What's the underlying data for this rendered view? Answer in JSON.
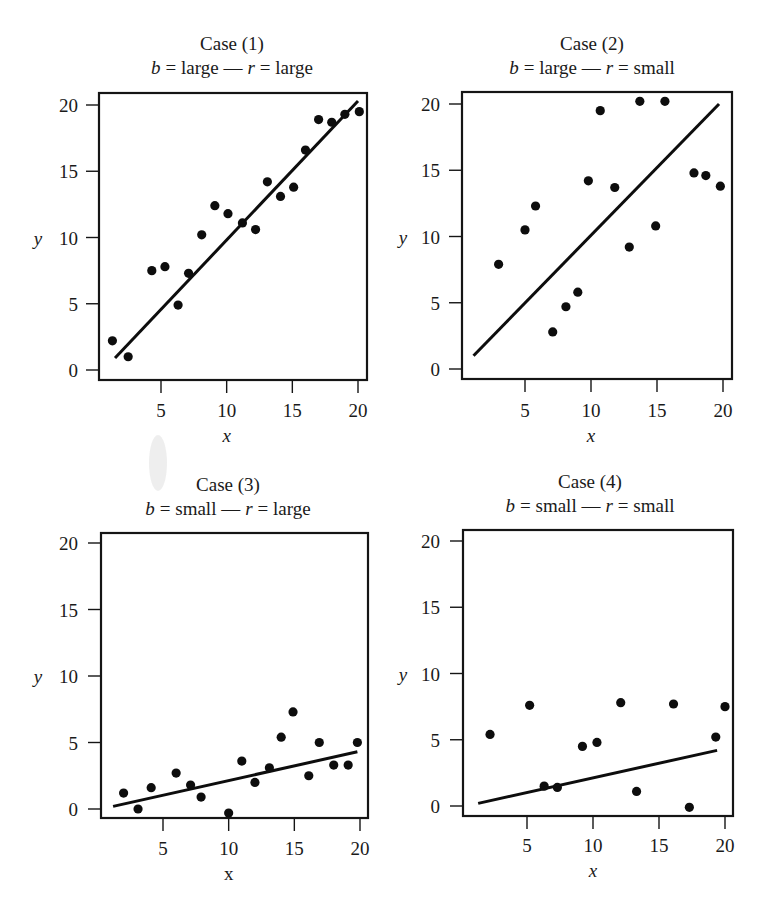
{
  "figure": {
    "panels_count": 4
  },
  "chart_data": [
    {
      "type": "scatter",
      "title": "Case (1)",
      "subtitle_parts": {
        "b_symbol": "b",
        "b_value": "= large —",
        "r_symbol": "r",
        "r_value": "= large"
      },
      "subtitle": "b = large — r = large",
      "xlabel": "x",
      "xlabel_italic": true,
      "ylabel": "y",
      "xticks": [
        5,
        10,
        15,
        20
      ],
      "yticks": [
        0,
        5,
        10,
        15,
        20
      ],
      "xlim": [
        0.8,
        20.6
      ],
      "ylim": [
        -0.8,
        20.8
      ],
      "grid": false,
      "points": [
        {
          "x": 1.3,
          "y": 2.2
        },
        {
          "x": 2.5,
          "y": 1.0
        },
        {
          "x": 4.3,
          "y": 7.5
        },
        {
          "x": 5.3,
          "y": 7.8
        },
        {
          "x": 6.3,
          "y": 4.9
        },
        {
          "x": 7.1,
          "y": 7.3
        },
        {
          "x": 8.1,
          "y": 10.2
        },
        {
          "x": 9.1,
          "y": 12.4
        },
        {
          "x": 10.1,
          "y": 11.8
        },
        {
          "x": 11.2,
          "y": 11.1
        },
        {
          "x": 12.2,
          "y": 10.6
        },
        {
          "x": 13.1,
          "y": 14.2
        },
        {
          "x": 14.1,
          "y": 13.1
        },
        {
          "x": 15.1,
          "y": 13.8
        },
        {
          "x": 16.0,
          "y": 16.6
        },
        {
          "x": 17.0,
          "y": 18.9
        },
        {
          "x": 18.0,
          "y": 18.7
        },
        {
          "x": 19.0,
          "y": 19.3
        },
        {
          "x": 20.1,
          "y": 19.5
        }
      ],
      "fit_line": {
        "x1": 1.5,
        "y1": 0.9,
        "x2": 20.0,
        "y2": 20.3
      }
    },
    {
      "type": "scatter",
      "title": "Case (2)",
      "subtitle_parts": {
        "b_symbol": "b",
        "b_value": "= large —",
        "r_symbol": "r",
        "r_value": "= small"
      },
      "subtitle": "b = large — r = small",
      "xlabel": "x",
      "xlabel_italic": true,
      "ylabel": "y",
      "xticks": [
        5,
        10,
        15,
        20
      ],
      "yticks": [
        0,
        5,
        10,
        15,
        20
      ],
      "xlim": [
        0.8,
        20.6
      ],
      "ylim": [
        -0.8,
        20.8
      ],
      "grid": false,
      "points": [
        {
          "x": 3.0,
          "y": 7.9
        },
        {
          "x": 5.0,
          "y": 10.5
        },
        {
          "x": 5.8,
          "y": 12.3
        },
        {
          "x": 7.1,
          "y": 2.8
        },
        {
          "x": 8.1,
          "y": 4.7
        },
        {
          "x": 9.0,
          "y": 5.8
        },
        {
          "x": 9.8,
          "y": 14.2
        },
        {
          "x": 10.7,
          "y": 19.5
        },
        {
          "x": 11.8,
          "y": 13.7
        },
        {
          "x": 12.9,
          "y": 9.2
        },
        {
          "x": 13.7,
          "y": 20.2
        },
        {
          "x": 14.9,
          "y": 10.8
        },
        {
          "x": 15.6,
          "y": 20.2
        },
        {
          "x": 17.8,
          "y": 14.8
        },
        {
          "x": 18.7,
          "y": 14.6
        },
        {
          "x": 19.8,
          "y": 13.8
        }
      ],
      "fit_line": {
        "x1": 1.1,
        "y1": 1.0,
        "x2": 19.7,
        "y2": 20.0
      }
    },
    {
      "type": "scatter",
      "title": "Case (3)",
      "subtitle_parts": {
        "b_symbol": "b",
        "b_value": "= small —",
        "r_symbol": "r",
        "r_value": "= large"
      },
      "subtitle": "b = small — r = large",
      "xlabel": "x",
      "xlabel_italic": false,
      "ylabel": "y",
      "xticks": [
        5,
        10,
        15,
        20
      ],
      "yticks": [
        0,
        5,
        10,
        15,
        20
      ],
      "xlim": [
        0.8,
        20.6
      ],
      "ylim": [
        -0.7,
        20.7
      ],
      "grid": false,
      "points": [
        {
          "x": 2.0,
          "y": 1.2
        },
        {
          "x": 3.1,
          "y": 0.0
        },
        {
          "x": 4.1,
          "y": 1.6
        },
        {
          "x": 6.0,
          "y": 2.7
        },
        {
          "x": 7.1,
          "y": 1.8
        },
        {
          "x": 7.9,
          "y": 0.9
        },
        {
          "x": 10.0,
          "y": -0.3
        },
        {
          "x": 11.0,
          "y": 3.6
        },
        {
          "x": 12.0,
          "y": 2.0
        },
        {
          "x": 13.1,
          "y": 3.1
        },
        {
          "x": 14.0,
          "y": 5.4
        },
        {
          "x": 14.9,
          "y": 7.3
        },
        {
          "x": 16.1,
          "y": 2.5
        },
        {
          "x": 16.9,
          "y": 5.0
        },
        {
          "x": 18.0,
          "y": 3.3
        },
        {
          "x": 19.1,
          "y": 3.3
        },
        {
          "x": 19.8,
          "y": 5.0
        }
      ],
      "fit_line": {
        "x1": 1.2,
        "y1": 0.2,
        "x2": 19.8,
        "y2": 4.3
      }
    },
    {
      "type": "scatter",
      "title": "Case (4)",
      "subtitle_parts": {
        "b_symbol": "b",
        "b_value": "= small —",
        "r_symbol": "r",
        "r_value": "= small"
      },
      "subtitle": "b = small — r = small",
      "xlabel": "x",
      "xlabel_italic": true,
      "ylabel": "y",
      "xticks": [
        5,
        10,
        15,
        20
      ],
      "yticks": [
        0,
        5,
        10,
        15,
        20
      ],
      "xlim": [
        0.8,
        20.6
      ],
      "ylim": [
        -0.8,
        20.8
      ],
      "grid": false,
      "points": [
        {
          "x": 2.2,
          "y": 5.4
        },
        {
          "x": 5.2,
          "y": 7.6
        },
        {
          "x": 6.3,
          "y": 1.5
        },
        {
          "x": 7.3,
          "y": 1.4
        },
        {
          "x": 9.2,
          "y": 4.5
        },
        {
          "x": 10.3,
          "y": 4.8
        },
        {
          "x": 12.1,
          "y": 7.8
        },
        {
          "x": 13.3,
          "y": 1.1
        },
        {
          "x": 16.1,
          "y": 7.7
        },
        {
          "x": 17.3,
          "y": -0.1
        },
        {
          "x": 19.3,
          "y": 5.2
        },
        {
          "x": 20.0,
          "y": 7.5
        }
      ],
      "fit_line": {
        "x1": 1.3,
        "y1": 0.2,
        "x2": 19.4,
        "y2": 4.2
      }
    }
  ],
  "layout": {
    "panels": [
      {
        "frame": {
          "left": 99,
          "top": 93,
          "right": 367,
          "bottom": 380
        },
        "x5px": 161,
        "x20px": 358,
        "y0px": 370,
        "y20px": 105,
        "title_cx": 232,
        "title_y1": 50,
        "title_y2": 74,
        "tick_label_y": 417,
        "xlabel_y": 442,
        "ylabel_x": 38,
        "tick_label_right": 78
      },
      {
        "frame": {
          "left": 462,
          "top": 92,
          "right": 732,
          "bottom": 379
        },
        "x5px": 525,
        "x20px": 723,
        "y0px": 369,
        "y20px": 104,
        "title_cx": 592,
        "title_y1": 50,
        "title_y2": 74,
        "tick_label_y": 417,
        "xlabel_y": 442,
        "ylabel_x": 403,
        "tick_label_right": 440
      },
      {
        "frame": {
          "left": 101,
          "top": 533,
          "right": 368,
          "bottom": 818
        },
        "x5px": 163,
        "x20px": 360,
        "y0px": 809,
        "y20px": 543,
        "title_cx": 228,
        "title_y1": 491,
        "title_y2": 515,
        "tick_label_y": 855,
        "xlabel_y": 880,
        "ylabel_x": 38,
        "tick_label_right": 78
      },
      {
        "frame": {
          "left": 463,
          "top": 530,
          "right": 733,
          "bottom": 816
        },
        "x5px": 527,
        "x20px": 725,
        "y0px": 806,
        "y20px": 541,
        "title_cx": 590,
        "title_y1": 488,
        "title_y2": 512,
        "tick_label_y": 852,
        "xlabel_y": 877,
        "ylabel_x": 403,
        "tick_label_right": 440
      }
    ]
  },
  "colors": {
    "ink": "#0d0d0d",
    "background": "#ffffff"
  }
}
